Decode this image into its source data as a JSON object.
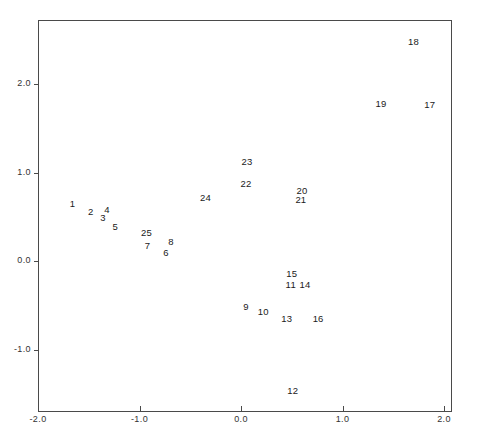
{
  "chart_data": {
    "type": "scatter",
    "title": "",
    "subtitle": "",
    "xlabel": "",
    "ylabel": "",
    "xlim": [
      -2.0,
      2.0
    ],
    "ylim": [
      -2.0,
      2.7
    ],
    "grid": false,
    "legend": null,
    "marker_style": "text-label",
    "xticks": [
      "-2.0",
      "-1.0",
      "0.0",
      "1.0",
      "2.0"
    ],
    "xtick_values": [
      -2.0,
      -1.0,
      0.0,
      1.0,
      2.0
    ],
    "yticks": [
      "-1.0",
      "0.0",
      "1.0",
      "2.0"
    ],
    "ytick_values": [
      -1.0,
      0.0,
      1.0,
      2.0
    ],
    "labels": [
      "1",
      "2",
      "3",
      "4",
      "5",
      "6",
      "7",
      "8",
      "9",
      "10",
      "11",
      "12",
      "13",
      "14",
      "15",
      "16",
      "17",
      "18",
      "19",
      "20",
      "21",
      "22",
      "23",
      "24",
      "25"
    ],
    "x": [
      -1.66,
      -1.48,
      -1.36,
      -1.32,
      -1.24,
      -0.74,
      -0.92,
      -0.69,
      0.05,
      0.22,
      0.49,
      0.51,
      0.45,
      0.63,
      0.5,
      0.76,
      1.86,
      1.7,
      1.38,
      0.6,
      0.59,
      0.05,
      0.06,
      -0.35,
      -0.93
    ],
    "y": [
      0.66,
      0.56,
      0.5,
      0.59,
      0.4,
      0.1,
      0.18,
      0.23,
      -0.51,
      -0.56,
      -0.26,
      -1.46,
      -0.64,
      -0.26,
      -0.14,
      -0.64,
      1.77,
      2.49,
      1.79,
      0.8,
      0.7,
      0.88,
      1.13,
      0.72,
      0.33
    ],
    "points": [
      {
        "label": "1",
        "x": -1.66,
        "y": 0.66
      },
      {
        "label": "2",
        "x": -1.48,
        "y": 0.56
      },
      {
        "label": "3",
        "x": -1.36,
        "y": 0.5
      },
      {
        "label": "4",
        "x": -1.32,
        "y": 0.59
      },
      {
        "label": "5",
        "x": -1.24,
        "y": 0.4
      },
      {
        "label": "6",
        "x": -0.74,
        "y": 0.1
      },
      {
        "label": "7",
        "x": -0.92,
        "y": 0.18
      },
      {
        "label": "8",
        "x": -0.69,
        "y": 0.23
      },
      {
        "label": "9",
        "x": 0.05,
        "y": -0.51
      },
      {
        "label": "10",
        "x": 0.22,
        "y": -0.56
      },
      {
        "label": "11",
        "x": 0.49,
        "y": -0.26
      },
      {
        "label": "12",
        "x": 0.51,
        "y": -1.46
      },
      {
        "label": "13",
        "x": 0.45,
        "y": -0.64
      },
      {
        "label": "14",
        "x": 0.63,
        "y": -0.26
      },
      {
        "label": "15",
        "x": 0.5,
        "y": -0.14
      },
      {
        "label": "16",
        "x": 0.76,
        "y": -0.64
      },
      {
        "label": "17",
        "x": 1.86,
        "y": 1.77
      },
      {
        "label": "18",
        "x": 1.7,
        "y": 2.49
      },
      {
        "label": "19",
        "x": 1.38,
        "y": 1.79
      },
      {
        "label": "20",
        "x": 0.6,
        "y": 0.8
      },
      {
        "label": "21",
        "x": 0.59,
        "y": 0.7
      },
      {
        "label": "22",
        "x": 0.05,
        "y": 0.88
      },
      {
        "label": "23",
        "x": 0.06,
        "y": 1.13
      },
      {
        "label": "24",
        "x": -0.35,
        "y": 0.72
      },
      {
        "label": "25",
        "x": -0.93,
        "y": 0.33
      }
    ]
  },
  "colors": {
    "axis": "#4a4a4a",
    "label_text": "#1a1a1a",
    "tick_text": "#333333",
    "background": "#ffffff"
  }
}
